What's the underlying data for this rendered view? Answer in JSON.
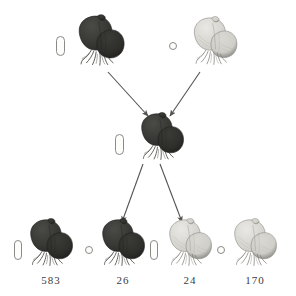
{
  "figure": {
    "type": "genetic-cross-diagram",
    "background_color": "#ffffff",
    "ink_color": "#3b3b3b",
    "symbol_outline_color": "#8a8a86"
  },
  "generations": [
    {
      "name": "parental",
      "row": "top",
      "individuals": [
        {
          "id": "p1",
          "sex_symbol": "pill",
          "sex_symbol_name": "male-symbol",
          "phenotype": "dark",
          "shade": "dark",
          "count_label": "",
          "x": 70,
          "y": 12,
          "w": 62,
          "h": 58,
          "symbol_x": 56,
          "symbol_y": 36,
          "symbol_w": 9,
          "symbol_h": 20
        },
        {
          "id": "p2",
          "sex_symbol": "circle",
          "sex_symbol_name": "female-symbol",
          "phenotype": "light",
          "shade": "light",
          "count_label": "",
          "x": 186,
          "y": 14,
          "w": 58,
          "h": 55,
          "symbol_x": 169,
          "symbol_y": 42,
          "symbol_w": 8,
          "symbol_h": 8
        }
      ]
    },
    {
      "name": "f1",
      "row": "middle",
      "individuals": [
        {
          "id": "f1",
          "sex_symbol": "pill",
          "sex_symbol_name": "male-symbol",
          "phenotype": "dark",
          "shade": "dark",
          "count_label": "",
          "x": 133,
          "y": 110,
          "w": 58,
          "h": 54,
          "symbol_x": 115,
          "symbol_y": 134,
          "symbol_w": 9,
          "symbol_h": 21
        }
      ]
    },
    {
      "name": "f2",
      "row": "bottom",
      "individuals": [
        {
          "id": "o1",
          "sex_symbol": "pill",
          "sex_symbol_name": "male-symbol",
          "phenotype": "dark",
          "shade": "dark",
          "count_label": "583",
          "x": 22,
          "y": 216,
          "w": 58,
          "h": 54,
          "symbol_x": 14,
          "symbol_y": 240,
          "symbol_w": 8,
          "symbol_h": 20
        },
        {
          "id": "o2",
          "sex_symbol": "circle",
          "sex_symbol_name": "female-symbol",
          "phenotype": "dark",
          "shade": "dark",
          "count_label": "26",
          "x": 94,
          "y": 216,
          "w": 58,
          "h": 54,
          "symbol_x": 85,
          "symbol_y": 246,
          "symbol_w": 8,
          "symbol_h": 8
        },
        {
          "id": "o3",
          "sex_symbol": "pill",
          "sex_symbol_name": "male-symbol",
          "phenotype": "light",
          "shade": "light",
          "count_label": "24",
          "x": 161,
          "y": 216,
          "w": 58,
          "h": 54,
          "symbol_x": 150,
          "symbol_y": 240,
          "symbol_w": 8,
          "symbol_h": 20
        },
        {
          "id": "o4",
          "sex_symbol": "circle",
          "sex_symbol_name": "female-symbol",
          "phenotype": "light",
          "shade": "light",
          "count_label": "170",
          "x": 226,
          "y": 216,
          "w": 58,
          "h": 54,
          "symbol_x": 217,
          "symbol_y": 246,
          "symbol_w": 8,
          "symbol_h": 8
        }
      ]
    }
  ],
  "counts": {
    "o1": "583",
    "o2": "26",
    "o3": "24",
    "o4": "170"
  },
  "arrows": [
    {
      "id": "a1",
      "from": "p1",
      "to": "f1",
      "x1": 108,
      "y1": 72,
      "x2": 148,
      "y2": 116
    },
    {
      "id": "a2",
      "from": "p2",
      "to": "f1",
      "x1": 200,
      "y1": 72,
      "x2": 170,
      "y2": 116
    },
    {
      "id": "a3",
      "from": "f1",
      "to": "o2",
      "x1": 143,
      "y1": 164,
      "x2": 122,
      "y2": 222
    },
    {
      "id": "a4",
      "from": "f1",
      "to": "o3",
      "x1": 160,
      "y1": 164,
      "x2": 182,
      "y2": 222
    }
  ]
}
